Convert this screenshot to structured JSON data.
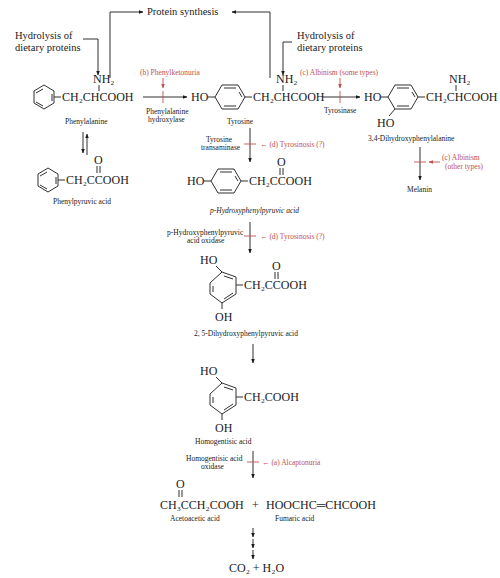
{
  "colors": {
    "text": "#1a1a1a",
    "disorder": "#c0504d",
    "background": "#ffffff"
  },
  "top": {
    "protein_synthesis": "Protein synthesis",
    "hydrolysis_left_1": "Hydrolysis of",
    "hydrolysis_left_2": "dietary proteins",
    "hydrolysis_right_1": "Hydrolysis of",
    "hydrolysis_right_2": "dietary proteins"
  },
  "compounds": {
    "phenylalanine": {
      "formula": "CH₂CHCOOH",
      "amine": "NH₂",
      "name": "Phenylalanine"
    },
    "phenylpyruvic": {
      "formula": "CH₂CCOOH",
      "keto": "O",
      "name": "Phenylpyruvic acid"
    },
    "tyrosine": {
      "ho": "HO",
      "formula": "CH₂CHCOOH",
      "amine": "NH₂",
      "name": "Tyrosine"
    },
    "dopa": {
      "ho": "HO",
      "ho2": "HO",
      "formula": "CH₂CHCOOH",
      "amine": "NH₂",
      "name": "3,4-Dihydroxyphenylalanine"
    },
    "melanin": {
      "name": "Melanin"
    },
    "hppa": {
      "ho": "HO",
      "formula": "CH₂CCOOH",
      "keto": "O",
      "name": "p-Hydroxyphenylpyruvic acid"
    },
    "dhppa": {
      "ho": "HO",
      "oh": "OH",
      "formula": "CH₂CCOOH",
      "keto": "O",
      "name": "2, 5-Dihydroxyphenylpyruvic acid"
    },
    "homogentisic": {
      "ho": "HO",
      "oh": "OH",
      "formula": "CH₂COOH",
      "name": "Homogentisic acid"
    },
    "products": {
      "acetoacetic_formula": "CH₃CCH₂COOH",
      "keto": "O",
      "plus": "+",
      "fumaric_formula": "HOOCHC═CHCOOH",
      "acetoacetic_name": "Acetoacetic acid",
      "fumaric_name": "Fumaric acid"
    },
    "final": "CO₂ + H₂O"
  },
  "enzymes": {
    "pah_1": "Phenylalanine",
    "pah_2": "hydroxylase",
    "tyrosinase": "Tyrosinase",
    "tat_1": "Tyrosine",
    "tat_2": "transaminase",
    "hppd_1": "p-Hydroxyphenylpyruvic",
    "hppd_2": "acid oxidase",
    "hgo_1": "Homogentisic acid",
    "hgo_2": "oxidase"
  },
  "disorders": {
    "pku": "(b)  Phenylketonuria",
    "albinism_some": "(c)  Albinism (some types)",
    "albinism_other_1": "(c) Albinism",
    "albinism_other_2": "(other types)",
    "tyrosinosis_1": "← (d)  Tyrosinosis (?)",
    "tyrosinosis_2": "← (d)  Tyrosinosis (?)",
    "alcaptonuria": "← (a)  Alcaptonuria"
  }
}
